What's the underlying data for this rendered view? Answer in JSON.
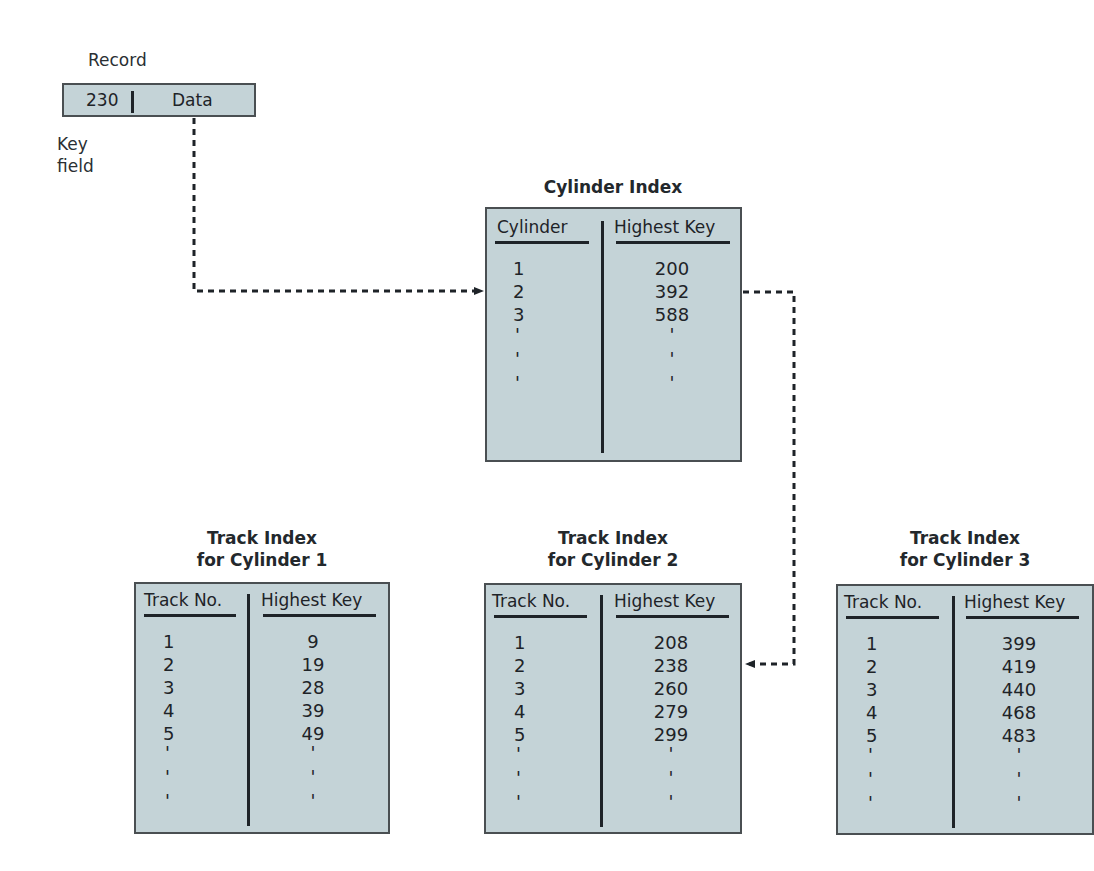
{
  "record": {
    "title": "Record",
    "key_value": "230",
    "data_label": "Data",
    "key_field_label_line1": "Key",
    "key_field_label_line2": "field"
  },
  "cylinder_index": {
    "title": "Cylinder Index",
    "col1_header": "Cylinder",
    "col2_header": "Highest Key",
    "rows": [
      {
        "c1": "1",
        "c2": "200"
      },
      {
        "c1": "2",
        "c2": "392"
      },
      {
        "c1": "3",
        "c2": "588"
      },
      {
        "c1": "'",
        "c2": "'"
      },
      {
        "c1": "'",
        "c2": "'"
      },
      {
        "c1": "'",
        "c2": "'"
      }
    ]
  },
  "track_indexes": [
    {
      "title_line1": "Track Index",
      "title_line2": "for Cylinder 1",
      "col1_header": "Track No.",
      "col2_header": "Highest Key",
      "rows": [
        {
          "c1": "1",
          "c2": "9"
        },
        {
          "c1": "2",
          "c2": "19"
        },
        {
          "c1": "3",
          "c2": "28"
        },
        {
          "c1": "4",
          "c2": "39"
        },
        {
          "c1": "5",
          "c2": "49"
        },
        {
          "c1": "'",
          "c2": "'"
        },
        {
          "c1": "'",
          "c2": "'"
        },
        {
          "c1": "'",
          "c2": "'"
        }
      ]
    },
    {
      "title_line1": "Track Index",
      "title_line2": "for Cylinder 2",
      "col1_header": "Track No.",
      "col2_header": "Highest Key",
      "rows": [
        {
          "c1": "1",
          "c2": "208"
        },
        {
          "c1": "2",
          "c2": "238"
        },
        {
          "c1": "3",
          "c2": "260"
        },
        {
          "c1": "4",
          "c2": "279"
        },
        {
          "c1": "5",
          "c2": "299"
        },
        {
          "c1": "'",
          "c2": "'"
        },
        {
          "c1": "'",
          "c2": "'"
        },
        {
          "c1": "'",
          "c2": "'"
        }
      ]
    },
    {
      "title_line1": "Track Index",
      "title_line2": "for Cylinder 3",
      "col1_header": "Track No.",
      "col2_header": "Highest Key",
      "rows": [
        {
          "c1": "1",
          "c2": "399"
        },
        {
          "c1": "2",
          "c2": "419"
        },
        {
          "c1": "3",
          "c2": "440"
        },
        {
          "c1": "4",
          "c2": "468"
        },
        {
          "c1": "5",
          "c2": "483"
        },
        {
          "c1": "'",
          "c2": "'"
        },
        {
          "c1": "'",
          "c2": "'"
        },
        {
          "c1": "'",
          "c2": "'"
        }
      ]
    }
  ],
  "colors": {
    "box_fill": "#c4d3d7",
    "box_border": "#4a4f52",
    "ink": "#1e2328"
  }
}
